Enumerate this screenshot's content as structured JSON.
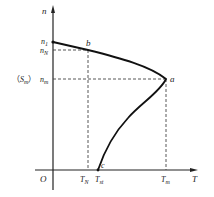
{
  "diagram": {
    "type": "motor-torque-speed-characteristic",
    "axes": {
      "y_label": "n",
      "x_label": "T",
      "origin_label": "O"
    },
    "y_ticks": [
      {
        "base": "n",
        "sub": "1"
      },
      {
        "base": "n",
        "sub": "N"
      },
      {
        "base": "n",
        "sub": "m"
      }
    ],
    "y_side_note": {
      "open": "（",
      "base": "S",
      "sub": "m",
      "close": "）"
    },
    "x_ticks": [
      {
        "base": "T",
        "sub": "N"
      },
      {
        "base": "T",
        "sub": "st"
      },
      {
        "base": "T",
        "sub": "m"
      }
    ],
    "points": [
      {
        "label": "b"
      },
      {
        "label": "a"
      },
      {
        "label": "c"
      }
    ],
    "colors": {
      "curve": "#111111",
      "axis": "#222222",
      "dash": "#444444"
    }
  }
}
